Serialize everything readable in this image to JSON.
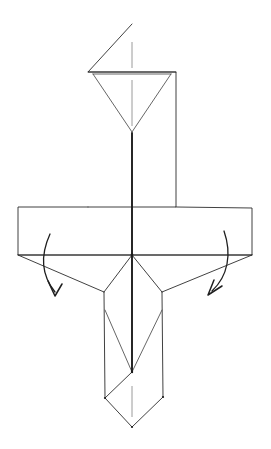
{
  "document": {
    "title": "Origami Folding Diagram",
    "kind": "line-drawing",
    "canvas": {
      "width": 271,
      "height": 449
    },
    "background_color": "#ffffff",
    "ink_color": "#2b2b2b",
    "crease_color": "#1c1c1c",
    "dashed_axis_color": "#9a9a9a",
    "arrow_color": "#1f1f1f"
  },
  "figure": {
    "name": "cross-shaped-paper-model",
    "symmetry_axis_x": 132
  },
  "shapes": {
    "top_roof_triangle": {
      "name": "top-roof-triangle",
      "points": "132,24 88,72 176,72"
    },
    "upper_body_outline": {
      "name": "upper-body-outline",
      "points": "88,72 176,72 176,207 88,207"
    },
    "inner_inverted_triangle": {
      "name": "inner-inverted-triangle",
      "left_edge": "93,74 132,132",
      "right_edge": "171,74 132,132",
      "base": "93,74 171,74"
    },
    "left_wing": {
      "name": "left-wing-panel",
      "points": "88,207 18,207 18,255 132,255"
    },
    "right_wing": {
      "name": "right-wing-panel",
      "points": "176,207 252,208 252,255 132,255"
    },
    "horizontal_crease": {
      "name": "horizontal-center-crease",
      "points": "18,255 252,255"
    },
    "left_lower_flap": {
      "name": "left-lower-flap-edge",
      "points": "18,255 104,292"
    },
    "right_lower_flap": {
      "name": "right-lower-flap-edge",
      "points": "252,255 162,292"
    },
    "center_to_left_flap": {
      "name": "center-to-left-flap-crease",
      "points": "132,255 104,292"
    },
    "center_to_right_flap": {
      "name": "center-to-right-flap-crease",
      "points": "132,255 162,292"
    },
    "lower_body_left_side": {
      "name": "lower-body-left-side",
      "points": "104,292 105,398"
    },
    "lower_body_right_side": {
      "name": "lower-body-right-side",
      "points": "162,292 163,397"
    },
    "inner_lower_v": {
      "name": "inner-lower-v-crease",
      "left_edge": "105,310 132,372",
      "right_edge": "162,310 132,372"
    },
    "bottom_diamond": {
      "name": "bottom-diamond-point",
      "points": "132,372 105,398 132,427 163,397"
    },
    "center_crease_vertical": {
      "name": "vertical-center-crease",
      "points": "132,133 132,372"
    }
  },
  "dashed_axes": [
    {
      "name": "dashed-axis-top",
      "x": 132,
      "y1": 42,
      "y2": 68
    },
    {
      "name": "dashed-axis-upper-inner",
      "x": 132,
      "y1": 80,
      "y2": 126
    },
    {
      "name": "dashed-axis-bottom",
      "x": 132,
      "y1": 386,
      "y2": 417
    }
  ],
  "arrows": [
    {
      "name": "left-fold-arrow",
      "label": "fold left wing down",
      "direction": "down-left",
      "path": "M 50,234 C 40,256 42,276 55,292",
      "head": "M 55,296 L 48,281 M 55,296 L 62,284"
    },
    {
      "name": "right-fold-arrow",
      "label": "fold right wing down",
      "direction": "down-left",
      "path": "M 224,231 C 232,254 228,276 212,291",
      "head": "M 208,295 L 214,280 M 208,295 L 222,286"
    }
  ],
  "vertices": [
    {
      "name": "center-vertex",
      "x": 132,
      "y": 255
    },
    {
      "name": "inner-v-apex-upper",
      "x": 132,
      "y": 132
    },
    {
      "name": "inner-v-apex-lower",
      "x": 132,
      "y": 372
    },
    {
      "name": "diamond-left-vertex",
      "x": 105,
      "y": 398
    },
    {
      "name": "diamond-right-vertex",
      "x": 163,
      "y": 397
    },
    {
      "name": "diamond-bottom-vertex",
      "x": 132,
      "y": 427
    }
  ]
}
